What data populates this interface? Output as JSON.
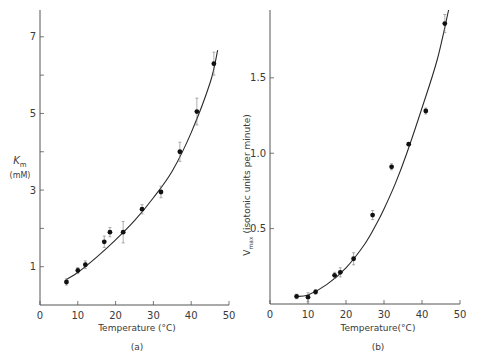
{
  "chart_data": [
    {
      "type": "scatter",
      "panel_label": "(a)",
      "title": "",
      "xlabel": "Temperature (°C)",
      "ylabel": "K_m (mM)",
      "ylabel_main": "K",
      "ylabel_sub": "m",
      "ylabel_unit": "(mM)",
      "xlim": [
        0,
        50
      ],
      "ylim": [
        0,
        7.7
      ],
      "xticks": [
        0,
        10,
        20,
        30,
        40,
        50
      ],
      "yticks": [
        1,
        2,
        3,
        4,
        5,
        6,
        7
      ],
      "ytick_labels": {
        "1": "1",
        "3": "3",
        "5": "5",
        "7": "7"
      },
      "grid": false,
      "series": [
        {
          "name": "measured",
          "x": [
            7,
            10,
            12,
            17,
            18.5,
            22,
            27,
            32,
            37,
            41.5,
            46
          ],
          "y": [
            0.6,
            0.9,
            1.05,
            1.65,
            1.9,
            1.9,
            2.5,
            2.95,
            4.0,
            5.05,
            6.3
          ],
          "err": [
            0.08,
            0.08,
            0.1,
            0.15,
            0.12,
            0.28,
            0.12,
            0.15,
            0.25,
            0.35,
            0.3
          ]
        },
        {
          "name": "fitted curve",
          "x": [
            7,
            10,
            15,
            20,
            25,
            30,
            35,
            40,
            45,
            47
          ],
          "y": [
            0.67,
            0.85,
            1.25,
            1.7,
            2.2,
            2.8,
            3.5,
            4.5,
            5.8,
            6.65
          ]
        }
      ]
    },
    {
      "type": "scatter",
      "panel_label": "(b)",
      "title": "",
      "xlabel": "Temperature(°C)",
      "ylabel": "V_max (isotonic units per minute)",
      "ylabel_main": "V",
      "ylabel_sub": "max",
      "ylabel_unit": "(isotonic units per minute)",
      "xlim": [
        0,
        50
      ],
      "ylim": [
        0,
        1.95
      ],
      "xticks": [
        0,
        10,
        20,
        30,
        40,
        50
      ],
      "yticks": [
        0.5,
        1.0,
        1.5
      ],
      "ytick_labels": {
        "0.5": "0.5",
        "1": "1.0",
        "1.5": "1.5"
      },
      "grid": false,
      "series": [
        {
          "name": "measured",
          "x": [
            7,
            10,
            12,
            17,
            18.5,
            22,
            27,
            32,
            36.5,
            41,
            46
          ],
          "y": [
            0.05,
            0.045,
            0.08,
            0.19,
            0.21,
            0.3,
            0.59,
            0.91,
            1.06,
            1.28,
            1.86
          ],
          "err": [
            0.015,
            0.03,
            0.015,
            0.02,
            0.03,
            0.04,
            0.03,
            0.02,
            0.01,
            0.02,
            0.06
          ]
        },
        {
          "name": "fitted curve",
          "x": [
            7,
            10,
            15,
            20,
            25,
            28,
            30,
            33,
            36,
            40,
            44,
            47
          ],
          "y": [
            0.05,
            0.06,
            0.13,
            0.24,
            0.4,
            0.53,
            0.63,
            0.8,
            1.0,
            1.3,
            1.62,
            1.95
          ]
        }
      ]
    }
  ]
}
